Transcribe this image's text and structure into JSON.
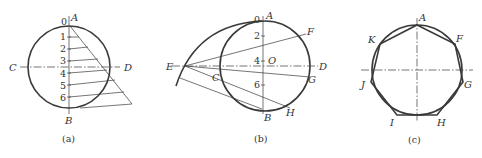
{
  "figure_a": {
    "caption": "(a)",
    "labels": {
      "A": "A",
      "B": "B",
      "C": "C",
      "D": "D"
    },
    "divisions": [
      "0",
      "1",
      "2",
      "3",
      "4",
      "5",
      "6"
    ]
  },
  "figure_b": {
    "caption": "(b)",
    "labels": {
      "A": "A",
      "B": "B",
      "C": "C",
      "D": "D",
      "E": "E",
      "F": "F",
      "G": "G",
      "H": "H",
      "O": "O"
    },
    "divisions": [
      "0",
      "2",
      "4",
      "6"
    ]
  },
  "figure_c": {
    "caption": "(c)",
    "labels": {
      "A": "A",
      "F": "F",
      "G": "G",
      "H": "H",
      "I": "I",
      "J": "J",
      "K": "K"
    }
  }
}
